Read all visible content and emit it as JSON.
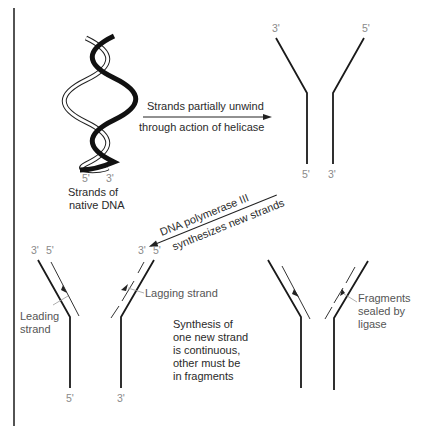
{
  "diagram": {
    "colors": {
      "strand": "#1a1a1a",
      "new_strand": "#333333",
      "prime_label": "#8a8a8a",
      "text": "#2a2a2a",
      "border": "#1a1a1a"
    },
    "panel_1": {
      "prime_left": "5'",
      "prime_right": "3'",
      "caption_line1": "Strands of",
      "caption_line2": "native DNA"
    },
    "arrow_1": {
      "label_top": "Strands partially unwind",
      "label_bottom": "through action of helicase"
    },
    "panel_2": {
      "top_left": "3'",
      "top_right": "5'",
      "bottom_left": "5'",
      "bottom_right": "3'"
    },
    "arrow_2": {
      "label_top": "DNA polymerase III",
      "label_bottom": "synthesizes new strands"
    },
    "panel_3": {
      "top_left_a": "3'",
      "top_left_b": "5'",
      "top_right_a": "3'",
      "top_right_b": "5'",
      "bottom_left": "5'",
      "bottom_right": "3'",
      "leading_line1": "Leading",
      "leading_line2": "strand",
      "lagging": "Lagging strand",
      "note_lines": [
        "Synthesis of",
        "one new strand",
        "is continuous,",
        "other must be",
        "in fragments"
      ]
    },
    "panel_4": {
      "label_lines": [
        "Fragments",
        "sealed by",
        "ligase"
      ]
    }
  }
}
